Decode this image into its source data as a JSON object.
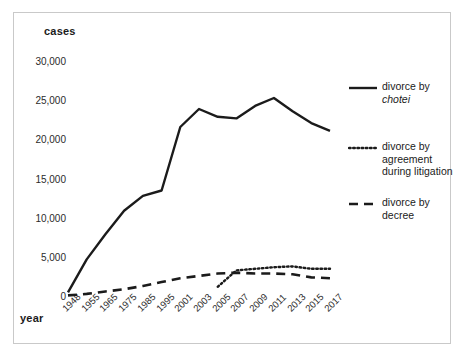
{
  "figure": {
    "y_axis_title": "cases",
    "x_axis_title": "year"
  },
  "legend": {
    "position": "right",
    "items": [
      {
        "label": "divorce by",
        "label2": "chotei",
        "label2_italic": true,
        "style": "solid",
        "name": "divorce-by-chotei"
      },
      {
        "label": "divorce by",
        "label2": "agreement during litigation",
        "label2_italic": false,
        "style": "dotted",
        "name": "divorce-by-agreement-during-litigation"
      },
      {
        "label": "divorce by",
        "label2": "decree",
        "label2_italic": false,
        "style": "dashed",
        "name": "divorce-by-decree"
      }
    ]
  },
  "chart_data": {
    "type": "line",
    "title": "",
    "xlabel": "year",
    "ylabel": "cases",
    "ylim": [
      0,
      30000
    ],
    "yticks": [
      0,
      5000,
      10000,
      15000,
      20000,
      25000,
      30000
    ],
    "ytick_labels": [
      "0",
      "5,000",
      "10,000",
      "15,000",
      "20,000",
      "25,000",
      "30,000"
    ],
    "categories": [
      "1948",
      "1955",
      "1965",
      "1975",
      "1985",
      "1995",
      "2001",
      "2003",
      "2005",
      "2007",
      "2009",
      "2011",
      "2013",
      "2015",
      "2017"
    ],
    "grid": false,
    "legend_position": "right",
    "series": [
      {
        "name": "divorce by chotei",
        "style": "solid",
        "color": "#1b1b1b",
        "values": [
          600,
          4800,
          8000,
          11000,
          12900,
          13600,
          21700,
          24000,
          23000,
          22800,
          24400,
          25400,
          23700,
          22200,
          21200
        ]
      },
      {
        "name": "divorce by agreement during litigation",
        "style": "dotted",
        "color": "#1b1b1b",
        "values": [
          null,
          null,
          null,
          null,
          null,
          null,
          null,
          null,
          1300,
          3400,
          3600,
          3800,
          3900,
          3600,
          3600
        ]
      },
      {
        "name": "divorce by decree",
        "style": "dashed",
        "color": "#1b1b1b",
        "values": [
          200,
          400,
          700,
          1000,
          1400,
          1900,
          2400,
          2700,
          3000,
          3100,
          3000,
          3000,
          2900,
          2500,
          2400
        ]
      }
    ]
  }
}
